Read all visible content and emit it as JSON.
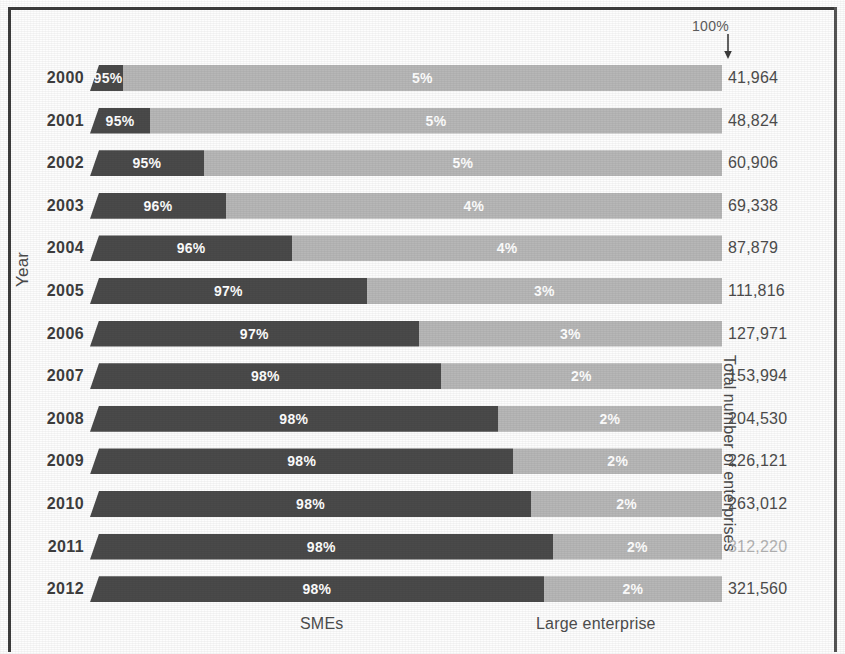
{
  "axes": {
    "y_title": "Year",
    "right_title": "Total number of enterprises"
  },
  "annotation": {
    "hundred_percent_label": "100%",
    "arrow_icon": "down-arrow-icon"
  },
  "legend": {
    "sme_label": "SMEs",
    "large_label": "Large enterprise"
  },
  "colors": {
    "sme": "#4a4a4a",
    "large": "#b7b7b7",
    "text": "#4d4d4d",
    "faded_text": "#b4b4b4",
    "frame": "#3c3c3c"
  },
  "chart_data": {
    "type": "bar",
    "title": "",
    "subtitle": "",
    "orientation": "horizontal",
    "stacked": true,
    "normalized": true,
    "xlabel": "",
    "ylabel": "Year",
    "secondary_ylabel": "Total number of enterprises",
    "grid": false,
    "legend_position": "bottom",
    "xlim": [
      0,
      100
    ],
    "categories": [
      "2000",
      "2001",
      "2002",
      "2003",
      "2004",
      "2005",
      "2006",
      "2007",
      "2008",
      "2009",
      "2010",
      "2011",
      "2012"
    ],
    "series": [
      {
        "name": "SMEs",
        "color": "#4a4a4a",
        "values": [
          95,
          95,
          95,
          96,
          96,
          97,
          97,
          98,
          98,
          98,
          98,
          98,
          98
        ],
        "labels": [
          "95%",
          "95%",
          "95%",
          "96%",
          "96%",
          "97%",
          "97%",
          "98%",
          "98%",
          "98%",
          "98%",
          "98%",
          "98%"
        ]
      },
      {
        "name": "Large enterprise",
        "color": "#b7b7b7",
        "values": [
          5,
          5,
          5,
          4,
          4,
          3,
          3,
          2,
          2,
          2,
          2,
          2,
          2
        ],
        "labels": [
          "5%",
          "5%",
          "5%",
          "4%",
          "4%",
          "3%",
          "3%",
          "2%",
          "2%",
          "2%",
          "2%",
          "2%",
          "2%"
        ]
      }
    ],
    "totals": {
      "name": "Total number of enterprises",
      "values": [
        41964,
        48824,
        60906,
        69338,
        87879,
        111816,
        127971,
        153994,
        204530,
        226121,
        263012,
        312220,
        321560
      ],
      "labels": [
        "41,964",
        "48,824",
        "60,906",
        "69,338",
        "87,879",
        "111,816",
        "127,971",
        "153,994",
        "204,530",
        "226,121",
        "263,012",
        "312,220",
        "321,560"
      ]
    },
    "annotations": [
      {
        "text": "100%",
        "target": "right end of bars",
        "marker": "down-arrow"
      }
    ]
  },
  "rows": [
    {
      "year": "2000",
      "sme_pct": "95%",
      "large_pct": "5%",
      "total": "41,964",
      "split": 5.2,
      "has_sliver": false,
      "faded_total": false
    },
    {
      "year": "2001",
      "sme_pct": "95%",
      "large_pct": "5%",
      "total": "48,824",
      "split": 9.5,
      "has_sliver": true,
      "faded_total": false
    },
    {
      "year": "2002",
      "sme_pct": "95%",
      "large_pct": "5%",
      "total": "60,906",
      "split": 18.0,
      "has_sliver": true,
      "faded_total": false
    },
    {
      "year": "2003",
      "sme_pct": "96%",
      "large_pct": "4%",
      "total": "69,338",
      "split": 21.5,
      "has_sliver": true,
      "faded_total": false
    },
    {
      "year": "2004",
      "sme_pct": "96%",
      "large_pct": "4%",
      "total": "87,879",
      "split": 32.0,
      "has_sliver": true,
      "faded_total": false
    },
    {
      "year": "2005",
      "sme_pct": "97%",
      "large_pct": "3%",
      "total": "111,816",
      "split": 43.8,
      "has_sliver": true,
      "faded_total": false
    },
    {
      "year": "2006",
      "sme_pct": "97%",
      "large_pct": "3%",
      "total": "127,971",
      "split": 52.0,
      "has_sliver": true,
      "faded_total": false
    },
    {
      "year": "2007",
      "sme_pct": "98%",
      "large_pct": "2%",
      "total": "153,994",
      "split": 55.5,
      "has_sliver": true,
      "faded_total": false
    },
    {
      "year": "2008",
      "sme_pct": "98%",
      "large_pct": "2%",
      "total": "204,530",
      "split": 64.5,
      "has_sliver": true,
      "faded_total": false
    },
    {
      "year": "2009",
      "sme_pct": "98%",
      "large_pct": "2%",
      "total": "226,121",
      "split": 67.0,
      "has_sliver": true,
      "faded_total": false
    },
    {
      "year": "2010",
      "sme_pct": "98%",
      "large_pct": "2%",
      "total": "263,012",
      "split": 69.8,
      "has_sliver": true,
      "faded_total": false
    },
    {
      "year": "2011",
      "sme_pct": "98%",
      "large_pct": "2%",
      "total": "312,220",
      "split": 73.2,
      "has_sliver": true,
      "faded_total": true
    },
    {
      "year": "2012",
      "sme_pct": "98%",
      "large_pct": "2%",
      "total": "321,560",
      "split": 71.8,
      "has_sliver": true,
      "faded_total": false
    }
  ]
}
